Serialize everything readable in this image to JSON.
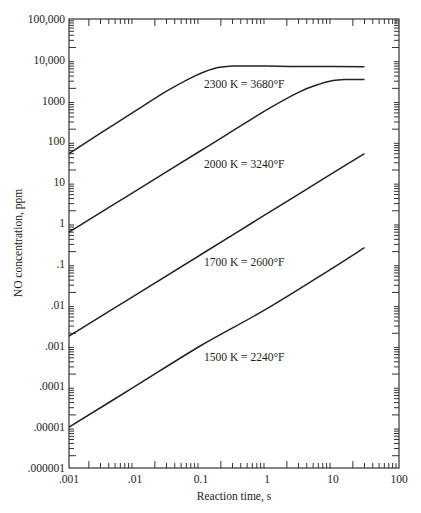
{
  "chart_data": {
    "type": "line",
    "title": "",
    "xlabel": "Reaction time, s",
    "ylabel": "NO concentration, ppm",
    "xscale": "log",
    "yscale": "log",
    "xlim": [
      0.001,
      100
    ],
    "ylim": [
      1e-06,
      100000
    ],
    "grid": false,
    "legend_position": "inline labels",
    "x_tick_labels": [
      ".001",
      ".01",
      "0.1",
      "1",
      "10",
      "100"
    ],
    "x_tick_values": [
      0.001,
      0.01,
      0.1,
      1,
      10,
      100
    ],
    "y_tick_labels": [
      "100,000",
      "10,000",
      "1000",
      "100",
      "10",
      "1",
      ".1",
      ".01",
      ".001",
      ".0001",
      ".00001",
      ".000001"
    ],
    "y_tick_values": [
      100000,
      10000,
      1000,
      100,
      10,
      1,
      0.1,
      0.01,
      0.001,
      0.0001,
      1e-05,
      1e-06
    ],
    "series": [
      {
        "name": "2300 K = 3680°F",
        "label": "2300 K = 3680°F",
        "x": [
          0.001,
          0.003,
          0.01,
          0.03,
          0.08,
          0.15,
          0.3,
          1,
          3,
          10,
          30
        ],
        "y": [
          50,
          160,
          550,
          1700,
          4000,
          6000,
          7000,
          7000,
          6900,
          6900,
          6800
        ]
      },
      {
        "name": "2000 K = 3240°F",
        "label": "2000 K = 3240°F",
        "x": [
          0.001,
          0.01,
          0.1,
          1,
          3,
          6,
          10,
          15,
          30
        ],
        "y": [
          0.6,
          6,
          60,
          600,
          1600,
          2500,
          3100,
          3300,
          3300
        ]
      },
      {
        "name": "1700 K = 2600°F",
        "label": "1700 K = 2600°F",
        "x": [
          0.001,
          0.01,
          0.1,
          1,
          10,
          30
        ],
        "y": [
          0.0017,
          0.017,
          0.17,
          1.7,
          17,
          50
        ]
      },
      {
        "name": "1500 K = 2240°F",
        "label": "1500 K = 2240°F",
        "x": [
          0.001,
          0.01,
          0.1,
          1,
          10,
          30
        ],
        "y": [
          1e-05,
          0.0001,
          0.001,
          0.008,
          0.08,
          0.25
        ]
      }
    ]
  }
}
